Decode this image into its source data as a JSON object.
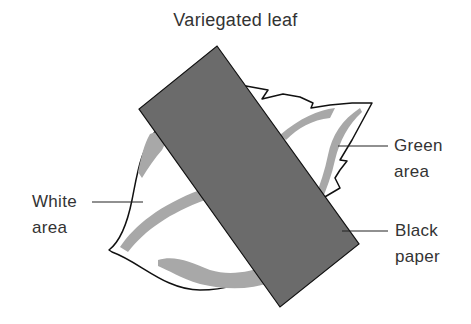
{
  "title": "Variegated leaf",
  "labels": {
    "green_area": "Green\narea",
    "white_area": "White\narea",
    "black_paper": "Black\npaper"
  },
  "colors": {
    "leaf_fill": "#ffffff",
    "green_band": "#a8a8a8",
    "black_paper": "#6b6b6b",
    "outline": "#111111",
    "text": "#333333"
  }
}
